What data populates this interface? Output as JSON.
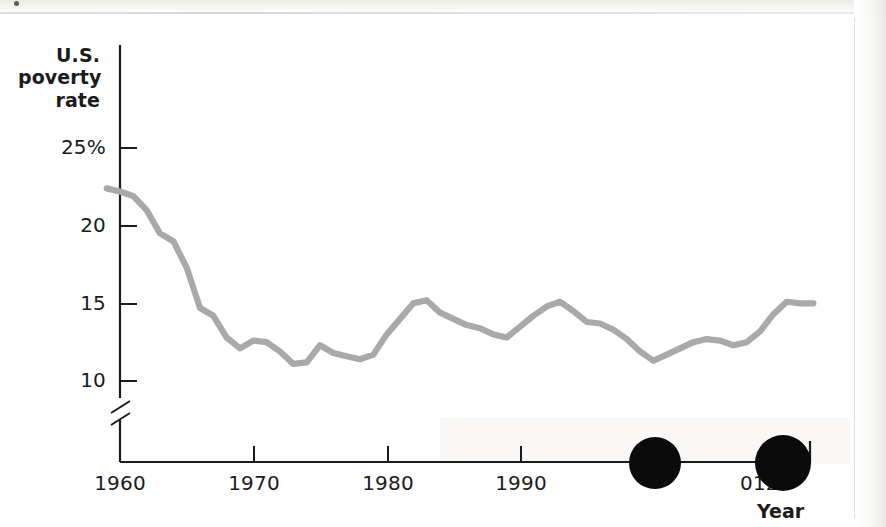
{
  "chart_data": {
    "type": "line",
    "title": "",
    "subtitle": "",
    "xlabel": "Year",
    "ylabel": "U.S. poverty rate",
    "ylabel_lines": [
      "U.S.",
      "poverty",
      "rate"
    ],
    "xlim": [
      1959,
      2012
    ],
    "ylim": [
      8.0,
      26.5
    ],
    "y_axis_break": true,
    "y_axis_break_note": "axis broken below 10",
    "grid": false,
    "legend": null,
    "line_color": "#a9a9a9",
    "axis_color": "#1b1b1b",
    "y_ticks": [
      {
        "value": 25,
        "label": "25%"
      },
      {
        "value": 20,
        "label": "20"
      },
      {
        "value": 15,
        "label": "15"
      },
      {
        "value": 10,
        "label": "10"
      }
    ],
    "x_ticks": [
      {
        "value": 1960,
        "label": "1960"
      },
      {
        "value": 1970,
        "label": "1970"
      },
      {
        "value": 1980,
        "label": "1980"
      },
      {
        "value": 1990,
        "label": "1990"
      },
      {
        "value": 2000,
        "label": "2000",
        "occluded": true
      },
      {
        "value": 2012,
        "label": "2012",
        "partially_occluded": true
      }
    ],
    "series": [
      {
        "name": "U.S. poverty rate",
        "x": [
          1959,
          1960,
          1961,
          1962,
          1963,
          1964,
          1965,
          1966,
          1967,
          1968,
          1969,
          1970,
          1971,
          1972,
          1973,
          1974,
          1975,
          1976,
          1977,
          1978,
          1979,
          1980,
          1981,
          1982,
          1983,
          1984,
          1985,
          1986,
          1987,
          1988,
          1989,
          1990,
          1991,
          1992,
          1993,
          1994,
          1995,
          1996,
          1997,
          1998,
          1999,
          2000,
          2001,
          2002,
          2003,
          2004,
          2005,
          2006,
          2007,
          2008,
          2009,
          2010,
          2011,
          2012
        ],
        "values": [
          22.4,
          22.2,
          21.9,
          21.0,
          19.5,
          19.0,
          17.3,
          14.7,
          14.2,
          12.8,
          12.1,
          12.6,
          12.5,
          11.9,
          11.1,
          11.2,
          12.3,
          11.8,
          11.6,
          11.4,
          11.7,
          13.0,
          14.0,
          15.0,
          15.2,
          14.4,
          14.0,
          13.6,
          13.4,
          13.0,
          12.8,
          13.5,
          14.2,
          14.8,
          15.1,
          14.5,
          13.8,
          13.7,
          13.3,
          12.7,
          11.9,
          11.3,
          11.7,
          12.1,
          12.5,
          12.7,
          12.6,
          12.3,
          12.5,
          13.2,
          14.3,
          15.1,
          15.0,
          15.0
        ]
      }
    ]
  },
  "axis": {
    "y_title_lines": [
      "U.S.",
      "poverty",
      "rate"
    ],
    "x_title": "Year",
    "y_tick_labels": [
      "25%",
      "20",
      "15",
      "10"
    ],
    "x_tick_labels": [
      "1960",
      "1970",
      "1980",
      "1990",
      "012"
    ]
  },
  "overlays": {
    "description": "Two solid black circular marks obscuring part of the x-axis",
    "marks": [
      {
        "name": "occluder-1",
        "covers": "2000"
      },
      {
        "name": "occluder-2",
        "covers": "2"
      }
    ]
  }
}
